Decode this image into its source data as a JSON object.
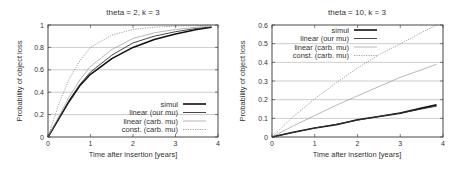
{
  "chart_data": [
    {
      "type": "line",
      "title": "theta = 2, k = 3",
      "xlabel": "Time after insertion [years]",
      "ylabel": "Probability of object loss",
      "xlim": [
        0,
        4
      ],
      "ylim": [
        0,
        1
      ],
      "xticks": [
        "0",
        "1",
        "2",
        "3",
        "4"
      ],
      "yticks": [
        "0",
        "0.2",
        "0.4",
        "0.6",
        "0.8",
        "1"
      ],
      "ytick_values": [
        0,
        0.2,
        0.4,
        0.6,
        0.8,
        1
      ],
      "grid": true,
      "legend_position": "bottom-right",
      "series": [
        {
          "name": "simul",
          "style": "thick-solid",
          "x": [
            0,
            0.25,
            0.5,
            0.75,
            1,
            1.5,
            2,
            2.5,
            3,
            3.5,
            3.85
          ],
          "y": [
            0,
            0.16,
            0.32,
            0.46,
            0.56,
            0.7,
            0.8,
            0.87,
            0.92,
            0.96,
            0.98
          ]
        },
        {
          "name": "linear (our mu)",
          "style": "solid",
          "x": [
            0,
            0.25,
            0.5,
            0.75,
            1,
            1.5,
            2,
            2.5,
            3,
            3.5,
            3.85
          ],
          "y": [
            0,
            0.16,
            0.33,
            0.47,
            0.58,
            0.73,
            0.84,
            0.9,
            0.94,
            0.97,
            0.98
          ]
        },
        {
          "name": "linear (carb. mu)",
          "style": "thin-solid",
          "x": [
            0,
            0.25,
            0.5,
            0.75,
            1,
            1.5,
            2,
            2.5,
            3,
            3.5,
            3.85
          ],
          "y": [
            0,
            0.18,
            0.36,
            0.51,
            0.63,
            0.78,
            0.88,
            0.93,
            0.96,
            0.98,
            0.99
          ]
        },
        {
          "name": "const. (carb. mu)",
          "style": "dotted",
          "x": [
            0,
            0.25,
            0.5,
            0.75,
            1,
            1.5,
            2,
            2.5,
            3,
            3.5,
            3.85
          ],
          "y": [
            0,
            0.29,
            0.52,
            0.68,
            0.8,
            0.91,
            0.96,
            0.98,
            0.99,
            0.995,
            0.998
          ]
        }
      ]
    },
    {
      "type": "line",
      "title": "theta = 10, k = 3",
      "xlabel": "Time after insertion [years]",
      "ylabel": "Probability of object loss",
      "xlim": [
        0,
        4
      ],
      "ylim": [
        0,
        0.6
      ],
      "xticks": [
        "0",
        "1",
        "2",
        "3",
        "4"
      ],
      "yticks": [
        "0",
        "0.1",
        "0.2",
        "0.3",
        "0.4",
        "0.5",
        "0.6"
      ],
      "ytick_values": [
        0,
        0.1,
        0.2,
        0.3,
        0.4,
        0.5,
        0.6
      ],
      "grid": true,
      "legend_position": "top-left",
      "series": [
        {
          "name": "simul",
          "style": "thick-solid",
          "x": [
            0,
            0.5,
            1,
            1.5,
            2,
            2.5,
            3,
            3.5,
            3.85
          ],
          "y": [
            0,
            0.025,
            0.048,
            0.066,
            0.092,
            0.11,
            0.128,
            0.155,
            0.172
          ]
        },
        {
          "name": "linear (our mu)",
          "style": "solid",
          "x": [
            0,
            0.5,
            1,
            1.5,
            2,
            2.5,
            3,
            3.5,
            3.85
          ],
          "y": [
            0,
            0.025,
            0.048,
            0.068,
            0.09,
            0.11,
            0.128,
            0.15,
            0.165
          ]
        },
        {
          "name": "linear (carb. mu)",
          "style": "thin-solid",
          "x": [
            0,
            0.5,
            1,
            1.5,
            2,
            2.5,
            3,
            3.5,
            3.85
          ],
          "y": [
            0,
            0.06,
            0.115,
            0.17,
            0.22,
            0.27,
            0.32,
            0.36,
            0.39
          ]
        },
        {
          "name": "const. (carb. mu)",
          "style": "dotted",
          "x": [
            0,
            0.5,
            1,
            1.5,
            2,
            2.5,
            3,
            3.5,
            3.85
          ],
          "y": [
            0,
            0.11,
            0.205,
            0.29,
            0.37,
            0.44,
            0.5,
            0.56,
            0.6
          ]
        }
      ]
    }
  ]
}
